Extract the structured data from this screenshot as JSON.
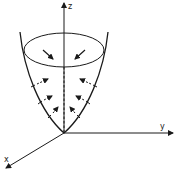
{
  "diagram": {
    "type": "paraboloid-surface-with-inward-normals",
    "axes": {
      "z": {
        "label": "z"
      },
      "y": {
        "label": "y"
      },
      "x": {
        "label": "x"
      }
    },
    "colors": {
      "stroke": "#1a1a1a",
      "background": "#ffffff"
    },
    "arrows": {
      "top_rim": 2,
      "left_side": 3,
      "right_side": 3,
      "direction": "inward-toward-z-axis"
    }
  }
}
